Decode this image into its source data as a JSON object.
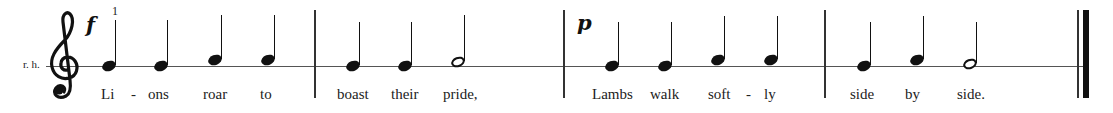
{
  "score": {
    "hand_label": "r. h.",
    "clef": "treble",
    "fingering": "1",
    "colors": {
      "ink": "#111111",
      "staff": "#555555",
      "background": "#ffffff"
    },
    "measures": [
      {
        "dynamic": "f",
        "notes": [
          {
            "type": "quarter",
            "pitch": "on-line",
            "lyric": "Li"
          },
          {
            "type": "quarter",
            "pitch": "on-line",
            "lyric": "ons"
          },
          {
            "type": "quarter",
            "pitch": "above-line",
            "lyric": "roar"
          },
          {
            "type": "quarter",
            "pitch": "above-line",
            "lyric": "to"
          }
        ],
        "hyphens": [
          "-"
        ]
      },
      {
        "notes": [
          {
            "type": "quarter",
            "pitch": "on-line",
            "lyric": "boast"
          },
          {
            "type": "quarter",
            "pitch": "on-line",
            "lyric": "their"
          },
          {
            "type": "half",
            "pitch": "above-line",
            "lyric": "pride,"
          }
        ]
      },
      {
        "dynamic": "p",
        "notes": [
          {
            "type": "quarter",
            "pitch": "on-line",
            "lyric": "Lambs"
          },
          {
            "type": "quarter",
            "pitch": "on-line",
            "lyric": "walk"
          },
          {
            "type": "quarter",
            "pitch": "above-line",
            "lyric": "soft"
          },
          {
            "type": "quarter",
            "pitch": "above-line",
            "lyric": "ly"
          }
        ],
        "hyphens": [
          "-"
        ]
      },
      {
        "notes": [
          {
            "type": "quarter",
            "pitch": "on-line",
            "lyric": "side"
          },
          {
            "type": "quarter",
            "pitch": "above-line",
            "lyric": "by"
          },
          {
            "type": "half",
            "pitch": "on-line",
            "lyric": "side."
          }
        ],
        "final_barline": "double-final"
      }
    ]
  }
}
